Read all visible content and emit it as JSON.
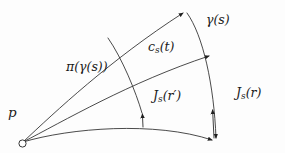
{
  "figure": {
    "background_color": "#fdfdfd",
    "stroke_color": "#2b2b2b",
    "text_color": "#1a1a1a",
    "width": 285,
    "height": 153
  },
  "labels": {
    "gamma_s": "γ(s)",
    "cs_t_base": "c",
    "cs_t_sub": "s",
    "cs_t_arg": "(t)",
    "pi_gamma_s": "π(γ(s))",
    "js_rprime_base": "J",
    "js_rprime_sub": "s",
    "js_rprime_arg": "(r′)",
    "js_r_base": "J",
    "js_r_sub": "s",
    "js_r_arg": "(r)",
    "point_p": "p"
  },
  "elements": {
    "basepoint_name": "p",
    "basepoint_style": "open-circle",
    "curve_top_name": "upper geodesic to gamma(s)",
    "curve_gamma_name": "gamma(s) transversal curve",
    "curve_middle_name": "c_s(t) middle geodesic",
    "curve_pi_name": "pi(gamma(s)) transversal curve",
    "curve_bottom_name": "lower geodesic",
    "vector_js_r_name": "Jacobi field J_s(r)",
    "vector_js_rprime_name": "Jacobi field J_s(r-prime)"
  },
  "geometry": {
    "basepoint": [
      22,
      143
    ],
    "top_arrow_tip": [
      186,
      11
    ],
    "gamma_end": [
      215,
      141
    ],
    "cs_arrow_tip": [
      212,
      55
    ],
    "js_r_arrow_tip": [
      213,
      112
    ],
    "js_rprime_arrow_tip": [
      143,
      117
    ],
    "bottom_end": [
      215,
      141
    ]
  }
}
